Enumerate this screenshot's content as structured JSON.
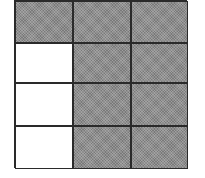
{
  "diagram": {
    "type": "fraction-grid",
    "rows": 4,
    "columns": 3,
    "total_cells": 12,
    "shaded_cells": 9,
    "unshaded_cells": 3,
    "colors": {
      "shaded": "#8e8e8e",
      "empty": "#ffffff",
      "border": "#2a2a2a"
    },
    "cells": [
      [
        "shaded",
        "shaded",
        "shaded"
      ],
      [
        "empty",
        "shaded",
        "shaded"
      ],
      [
        "empty",
        "shaded",
        "shaded"
      ],
      [
        "empty",
        "shaded",
        "shaded"
      ]
    ]
  }
}
